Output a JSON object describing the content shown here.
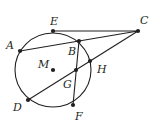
{
  "diagram": {
    "type": "geometry-circle-secants-tangent",
    "circle": {
      "center_label": "M",
      "cx": 53,
      "cy": 70,
      "r": 38
    },
    "points": [
      {
        "id": "E",
        "label": "E",
        "x": 53,
        "y": 31,
        "lx": 50,
        "ly": 25
      },
      {
        "id": "C",
        "label": "C",
        "x": 138,
        "y": 31,
        "lx": 140,
        "ly": 24
      },
      {
        "id": "A",
        "label": "A",
        "x": 20,
        "y": 51,
        "lx": 6,
        "ly": 49
      },
      {
        "id": "B",
        "label": "B",
        "x": 79,
        "y": 41,
        "lx": 68,
        "ly": 55
      },
      {
        "id": "M",
        "label": "M",
        "x": 53,
        "y": 70,
        "lx": 38,
        "ly": 68
      },
      {
        "id": "G",
        "label": "G",
        "x": 76,
        "y": 70,
        "lx": 63,
        "ly": 88
      },
      {
        "id": "H",
        "label": "H",
        "x": 90,
        "y": 61,
        "lx": 97,
        "ly": 73
      },
      {
        "id": "D",
        "label": "D",
        "x": 28,
        "y": 100,
        "lx": 13,
        "ly": 111
      },
      {
        "id": "F",
        "label": "F",
        "x": 73,
        "y": 105,
        "lx": 75,
        "ly": 120
      }
    ],
    "segments": [
      {
        "from": "E",
        "to": "C"
      },
      {
        "from": "A",
        "to": "C"
      },
      {
        "from": "D",
        "to": "C"
      },
      {
        "from": "B",
        "to": "F"
      }
    ]
  }
}
